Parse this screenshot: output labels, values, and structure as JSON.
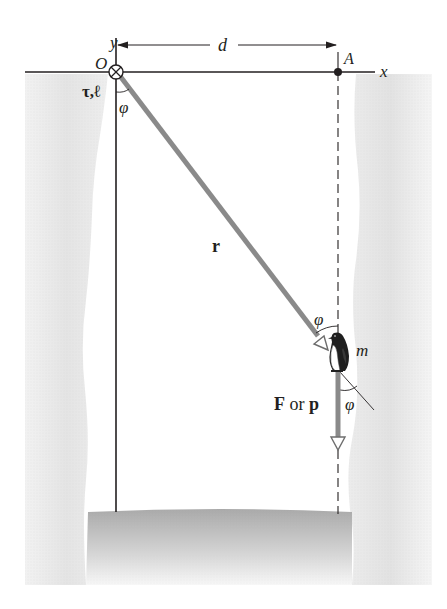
{
  "figure": {
    "type": "physics-diagram"
  },
  "labels": {
    "y_axis": "y",
    "x_axis": "x",
    "origin": "O",
    "point_a": "A",
    "distance": "d",
    "torque_angmom": "τ,ℓ",
    "phi_origin": "φ",
    "position_vector": "r",
    "phi_near_penguin": "φ",
    "mass": "m",
    "phi_below": "φ",
    "force_or_momentum_bold_f": "F",
    "force_or_momentum_or": " or ",
    "force_or_momentum_bold_p": "p"
  },
  "colors": {
    "axis_line": "#231f20",
    "vector_gray": "#8a8a8a",
    "vector_outline": "#6d6d6d",
    "cliff_gray": "#e6e6e6",
    "cliff_dark": "#d8d8d8",
    "ground_top": "#a8a8a8",
    "ground_bottom": "#f2f2f2",
    "background": "#ffffff"
  }
}
